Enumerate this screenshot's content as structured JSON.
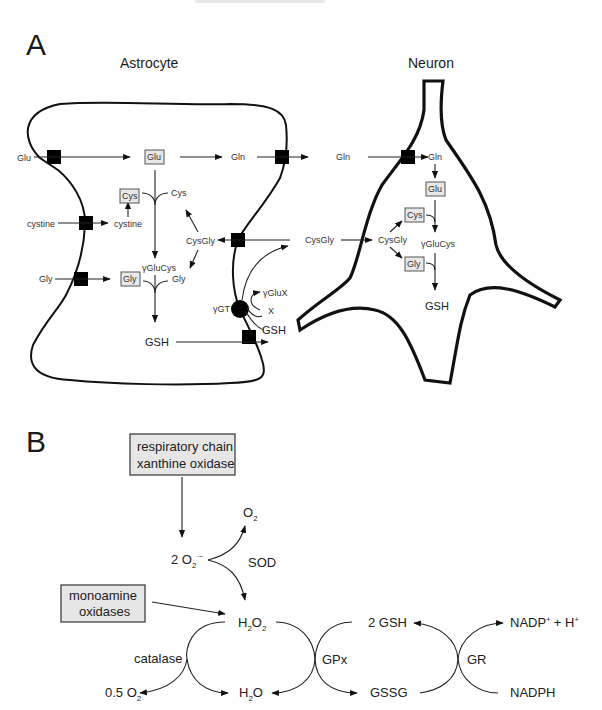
{
  "panel_a": {
    "letter": "A",
    "astrocyte_title": "Astrocyte",
    "neuron_title": "Neuron",
    "astrocyte": {
      "glu_ext": "Glu",
      "glu_box": "Glu",
      "gln": "Gln",
      "cystine_ext": "cystine",
      "cystine_int": "cystine",
      "cys_box": "Cys",
      "cys": "Cys",
      "gly_ext": "Gly",
      "gly_box": "Gly",
      "gly": "Gly",
      "gluCys": "γGluCys",
      "cysGly": "CysGly",
      "gsh": "GSH",
      "ggt": "γGT",
      "gluX": "γGluX",
      "x": "X",
      "gsh_ext": "GSH"
    },
    "extracellular": {
      "gln": "Gln",
      "cysGly": "CysGly"
    },
    "neuron": {
      "gln": "Gln",
      "glu_box": "Glu",
      "cys_box": "Cys",
      "cysGly": "CysGly",
      "gluCys": "γGluCys",
      "gly_box": "Gly",
      "gsh": "GSH"
    }
  },
  "panel_b": {
    "letter": "B",
    "source_box_1": [
      "respiratory chain",
      "xanthine oxidase"
    ],
    "source_box_2": [
      "monoamine",
      "oxidases"
    ],
    "superoxide": {
      "prefix": "2 O",
      "sub": "2",
      "sup": "·−"
    },
    "o2": {
      "main": "O",
      "sub": "2"
    },
    "sod": "SOD",
    "h2o2": {
      "a": "H",
      "s1": "2",
      "b": "O",
      "s2": "2"
    },
    "catalase": "catalase",
    "half_o2": {
      "main": "0.5 O",
      "sub": "2"
    },
    "h2o": {
      "a": "H",
      "s1": "2",
      "b": "O"
    },
    "gpx": "GPx",
    "gsh2": "2 GSH",
    "gssg": "GSSG",
    "gr": "GR",
    "nadp": {
      "a": "NADP",
      "sup1": "+",
      "b": " + H",
      "sup2": "+"
    },
    "nadph": "NADPH"
  }
}
